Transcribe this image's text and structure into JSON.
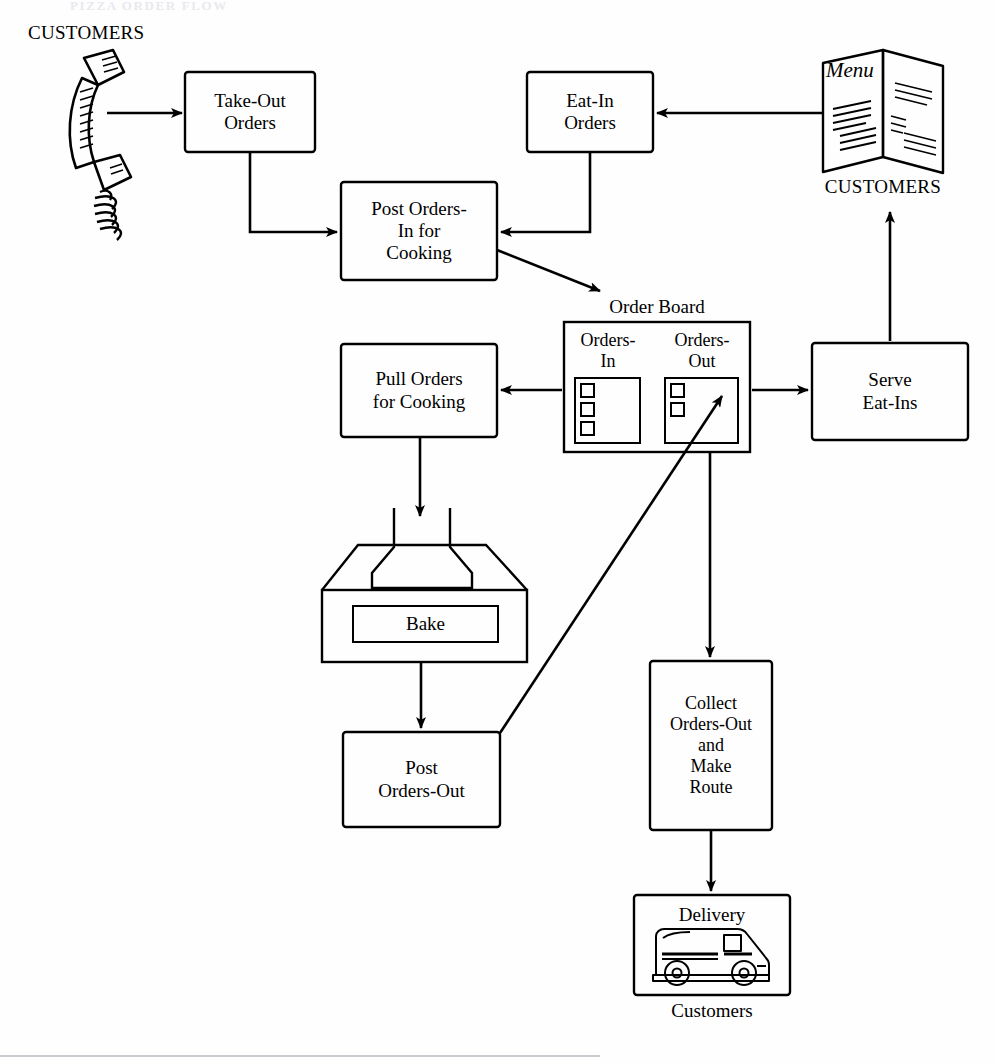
{
  "diagram": {
    "title_fragment": "PIZZA ORDER FLOW",
    "nodes": {
      "take_out_orders": "Take-Out\nOrders",
      "eat_in_orders": "Eat-In\nOrders",
      "post_orders_in": "Post Orders-\nIn for\nCooking",
      "pull_orders": "Pull Orders\nfor Cooking",
      "bake": "Bake",
      "post_orders_out": "Post\nOrders-Out",
      "serve_eat_ins": "Serve\nEat-Ins",
      "collect_orders_out": "Collect\nOrders-Out\nand\nMake\nRoute",
      "delivery": "Delivery"
    },
    "order_board": {
      "title": "Order Board",
      "left_panel": "Orders-\nIn",
      "right_panel": "Orders-\nOut",
      "left_ticket_count": 3,
      "right_ticket_count": 2
    },
    "actors": {
      "phone_customers": "CUSTOMERS",
      "menu_customers": "CUSTOMERS",
      "menu_label": "Menu",
      "delivery_customers": "Customers"
    },
    "icons": {
      "phone": "telephone-handset-icon",
      "menu": "folded-menu-icon",
      "oven": "pizza-oven-icon",
      "truck": "delivery-truck-icon"
    },
    "colors": {
      "stroke": "#000000",
      "background": "#ffffff"
    }
  }
}
